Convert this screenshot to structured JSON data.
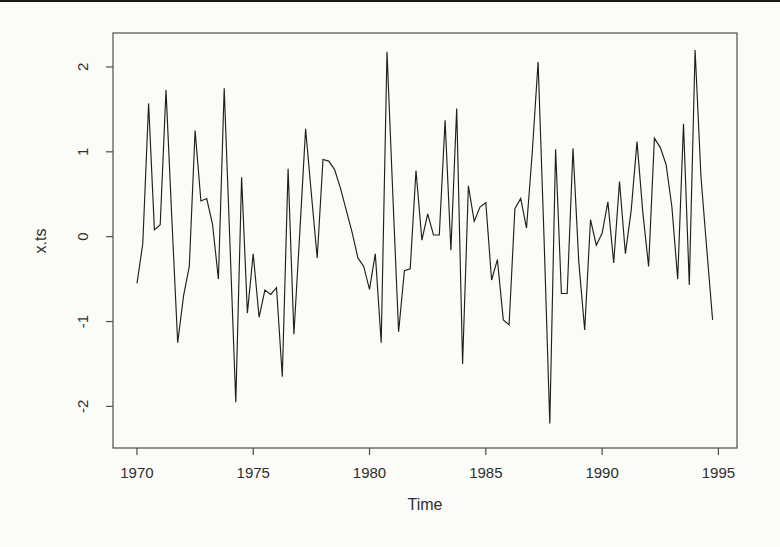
{
  "figure": {
    "background_color": "#fbfbf8",
    "scan_edge_color": "#1a1a1a",
    "frame_color": "#4d4d4d"
  },
  "chart_data": {
    "type": "line",
    "title": "",
    "xlabel": "Time",
    "ylabel": "x.ts",
    "legend": null,
    "grid": false,
    "series_name": "x.ts",
    "frequency": "quarterly",
    "x_start": 1970.0,
    "x_step": 0.25,
    "x_ticks": [
      1970,
      1975,
      1980,
      1985,
      1990,
      1995
    ],
    "y_ticks": [
      -2,
      -1,
      0,
      1,
      2
    ],
    "xlim": [
      1968.97,
      1995.8
    ],
    "ylim": [
      -2.49,
      2.4
    ],
    "line_color": "#1f1f1f",
    "values": [
      -0.55,
      -0.08,
      1.57,
      0.08,
      0.14,
      1.73,
      0.22,
      -1.25,
      -0.7,
      -0.35,
      1.25,
      0.42,
      0.45,
      0.15,
      -0.5,
      1.75,
      -0.1,
      -1.95,
      0.7,
      -0.9,
      -0.2,
      -0.95,
      -0.63,
      -0.68,
      -0.6,
      -1.65,
      0.8,
      -1.15,
      0.05,
      1.27,
      0.5,
      -0.25,
      0.91,
      0.89,
      0.79,
      0.57,
      0.31,
      0.05,
      -0.25,
      -0.35,
      -0.62,
      -0.2,
      -1.25,
      2.18,
      0.5,
      -1.12,
      -0.4,
      -0.38,
      0.78,
      -0.04,
      0.27,
      0.02,
      0.02,
      1.37,
      -0.16,
      1.51,
      -1.5,
      0.6,
      0.18,
      0.35,
      0.4,
      -0.51,
      -0.27,
      -0.98,
      -1.04,
      0.33,
      0.45,
      0.1,
      1.0,
      2.06,
      0.0,
      -2.2,
      1.03,
      -0.67,
      -0.67,
      1.04,
      -0.3,
      -1.1,
      0.2,
      -0.1,
      0.04,
      0.41,
      -0.31,
      0.65,
      -0.2,
      0.31,
      1.12,
      0.29,
      -0.35,
      1.16,
      1.05,
      0.85,
      0.35,
      -0.5,
      1.33,
      -0.57,
      2.2,
      0.7,
      -0.15,
      -0.98
    ]
  }
}
